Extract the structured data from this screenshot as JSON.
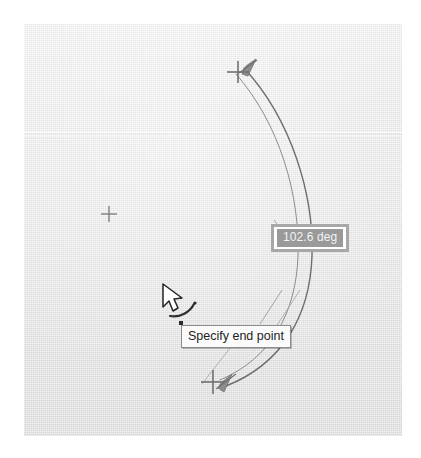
{
  "app": {
    "context": "cad-arc-drawing-canvas",
    "canvas_background_color": "#e9e9e9",
    "geometry_stroke_color": "#6e6e6e"
  },
  "dynamic_input": {
    "angle_tooltip": {
      "name": "angle-dimension-input",
      "value": "102.6 deg",
      "selected": true,
      "field_background_color": "#9a9a9a",
      "field_text_color": "#f2f2f2",
      "frame_color": "#a8a8a8",
      "inner_background_color": "#ffffff"
    },
    "prompt_tooltip": {
      "name": "command-prompt-tooltip",
      "text": "Specify end point",
      "background_color": "#fbfbfb",
      "border_color": "#8d8d8d",
      "text_color": "#1d1d1d"
    }
  },
  "markers": {
    "center_point": {
      "label": "arc-center-node",
      "x": 109,
      "y": 214,
      "glyph": "plus-marker"
    },
    "start_point": {
      "label": "arc-start-node",
      "x": 239,
      "y": 72,
      "glyph": "plus-marker"
    },
    "end_point": {
      "label": "arc-end-node",
      "x": 213,
      "y": 382,
      "glyph": "plus-marker"
    }
  },
  "cursor": {
    "name": "arc-tool-cursor",
    "x": 163,
    "y": 288,
    "glyph": "arrow-pointer-with-arc-badge"
  },
  "arcs": {
    "outer": {
      "name": "outer-arc-curve",
      "stroke": "#6e6e6e",
      "width": 1.3
    },
    "inner": {
      "name": "inner-arc-curve",
      "stroke": "#8a8a8a",
      "width": 1.0
    }
  },
  "arrowheads": {
    "top": {
      "name": "arc-direction-arrow-top"
    },
    "bottom": {
      "name": "arc-direction-arrow-bottom"
    }
  }
}
